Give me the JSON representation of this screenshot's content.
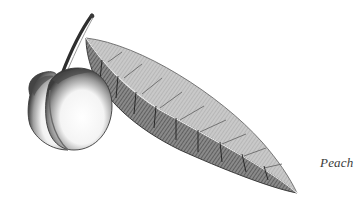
{
  "caption": "Peach",
  "illustration": {
    "subject": "peach-fruit-with-leaf",
    "style": "monochrome engraving",
    "colors": {
      "background": "#ffffff",
      "ink_dark": "#2a2a2a",
      "ink_mid": "#6e6e6e",
      "ink_light": "#b5b5b5"
    }
  }
}
